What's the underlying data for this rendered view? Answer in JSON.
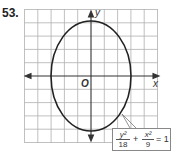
{
  "problem_number": "53.",
  "axes": {
    "x_label": "x",
    "y_label": "y",
    "origin_label": "O"
  },
  "equation": {
    "term1_num": "y²",
    "term1_den": "18",
    "plus": "+",
    "term2_num": "x²",
    "term2_den": "9",
    "rhs": "= 1"
  },
  "graph": {
    "grid_unit_px": 13.3,
    "ellipse": {
      "center": [
        0,
        0
      ],
      "semi_x": 3,
      "semi_y": 4.24
    },
    "colors": {
      "grid": "#aaaaaa",
      "axis": "#333333",
      "curve": "#222222"
    }
  }
}
